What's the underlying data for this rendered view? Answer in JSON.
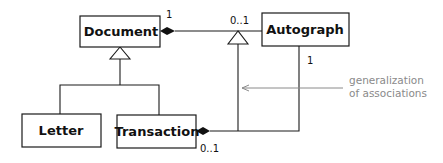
{
  "classes": {
    "document": "Document",
    "autograph": "Autograph",
    "letter": "Letter",
    "transaction": "Transaction"
  },
  "multiplicities": {
    "document_end": "1",
    "autograph_left_end": "0..1",
    "autograph_down_end": "1",
    "transaction_end": "0..1"
  },
  "annotation": {
    "line1": "generalization",
    "line2": "of associations"
  }
}
